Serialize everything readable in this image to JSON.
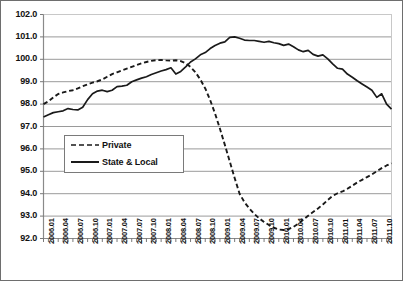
{
  "chart_data": {
    "type": "line",
    "title": "",
    "subtitle": "",
    "xlabel": "",
    "ylabel": "",
    "ylim": [
      92.0,
      102.0
    ],
    "ytick_labels": [
      "102.0",
      "101.0",
      "100.0",
      "99.0",
      "98.0",
      "97.0",
      "96.0",
      "95.0",
      "94.0",
      "93.0",
      "92.0"
    ],
    "ytick_values": [
      102.0,
      101.0,
      100.0,
      99.0,
      98.0,
      97.0,
      96.0,
      95.0,
      94.0,
      93.0,
      92.0
    ],
    "grid": true,
    "grid_axis": "y",
    "legend_position": "center-left-inside",
    "x": [
      "2006.01",
      "2006.02",
      "2006.03",
      "2006.04",
      "2006.05",
      "2006.06",
      "2006.07",
      "2006.08",
      "2006.09",
      "2006.10",
      "2006.11",
      "2006.12",
      "2007.01",
      "2007.02",
      "2007.03",
      "2007.04",
      "2007.05",
      "2007.06",
      "2007.07",
      "2007.08",
      "2007.09",
      "2007.10",
      "2007.11",
      "2007.12",
      "2008.01",
      "2008.02",
      "2008.03",
      "2008.04",
      "2008.05",
      "2008.06",
      "2008.07",
      "2008.08",
      "2008.09",
      "2008.10",
      "2008.11",
      "2008.12",
      "2009.01",
      "2009.02",
      "2009.03",
      "2009.04",
      "2009.05",
      "2009.06",
      "2009.07",
      "2009.08",
      "2009.09",
      "2009.10",
      "2009.11",
      "2009.12",
      "2010.01",
      "2010.02",
      "2010.03",
      "2010.04",
      "2010.05",
      "2010.06",
      "2010.07",
      "2010.08",
      "2010.09",
      "2010.10",
      "2010.11",
      "2010.12",
      "2011.01",
      "2011.02",
      "2011.03",
      "2011.04",
      "2011.05",
      "2011.06",
      "2011.07",
      "2011.08",
      "2011.09",
      "2011.10",
      "2011.11",
      "2011.12"
    ],
    "xtick_labels": [
      "2006.01",
      "2006.04",
      "2006.07",
      "2006.10",
      "2007.01",
      "2007.04",
      "2007.07",
      "2007.10",
      "2008.01",
      "2008.04",
      "2008.07",
      "2008.10",
      "2009.01",
      "2009.04",
      "2009.07",
      "2009.10",
      "2010.01",
      "2010.04",
      "2010.07",
      "2010.10",
      "2011.01",
      "2011.04",
      "2011.07",
      "2011.10"
    ],
    "series": [
      {
        "name": "Private",
        "style": "dashed",
        "color": "#1a1a1a",
        "values": [
          98.0,
          98.12,
          98.3,
          98.45,
          98.52,
          98.58,
          98.62,
          98.7,
          98.8,
          98.88,
          98.96,
          99.02,
          99.1,
          99.22,
          99.34,
          99.42,
          99.5,
          99.58,
          99.66,
          99.74,
          99.82,
          99.88,
          99.93,
          99.96,
          99.97,
          99.95,
          99.94,
          99.96,
          99.92,
          99.82,
          99.66,
          99.42,
          99.1,
          98.7,
          98.18,
          97.58,
          96.9,
          96.18,
          95.44,
          94.7,
          94.0,
          93.62,
          93.34,
          93.1,
          92.9,
          92.74,
          92.6,
          92.48,
          92.4,
          92.38,
          92.42,
          92.52,
          92.66,
          92.84,
          93.02,
          93.18,
          93.34,
          93.52,
          93.72,
          93.9,
          94.02,
          94.1,
          94.22,
          94.36,
          94.5,
          94.62,
          94.74,
          94.86,
          95.0,
          95.14,
          95.26,
          95.36
        ]
      },
      {
        "name": "State & Local",
        "style": "solid",
        "color": "#1a1a1a",
        "values": [
          97.42,
          97.52,
          97.62,
          97.66,
          97.7,
          97.8,
          97.76,
          97.74,
          97.86,
          98.2,
          98.46,
          98.58,
          98.62,
          98.56,
          98.62,
          98.78,
          98.8,
          98.84,
          99.0,
          99.08,
          99.16,
          99.22,
          99.32,
          99.4,
          99.48,
          99.54,
          99.62,
          99.34,
          99.46,
          99.66,
          99.88,
          100.02,
          100.2,
          100.3,
          100.48,
          100.62,
          100.72,
          100.78,
          100.98,
          101.0,
          100.94,
          100.86,
          100.84,
          100.84,
          100.8,
          100.76,
          100.8,
          100.74,
          100.7,
          100.62,
          100.68,
          100.56,
          100.42,
          100.34,
          100.4,
          100.22,
          100.14,
          100.2,
          100.02,
          99.8,
          99.6,
          99.56,
          99.34,
          99.2,
          99.04,
          98.9,
          98.76,
          98.62,
          98.3,
          98.46,
          98.0,
          97.78
        ]
      }
    ]
  },
  "legend": {
    "items": [
      {
        "label": "Private",
        "style": "dashed"
      },
      {
        "label": "State & Local",
        "style": "solid"
      }
    ]
  }
}
